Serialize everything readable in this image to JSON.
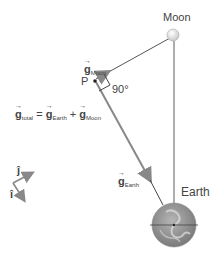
{
  "labels": {
    "moon": "Moon",
    "earth": "Earth",
    "point": "P",
    "angle": "90°",
    "g_moon_symbol": "g",
    "g_moon_sub": "Moon",
    "g_earth_symbol": "g",
    "g_earth_sub": "Earth",
    "equation": {
      "lhs_symbol": "g",
      "lhs_sub": "total",
      "equals": "=",
      "term1_symbol": "g",
      "term1_sub": "Earth",
      "plus": "+",
      "term2_symbol": "g",
      "term2_sub": "Moon"
    },
    "unit_i": "î",
    "unit_j": "ĵ"
  },
  "colors": {
    "line": "#666666",
    "arrow": "#888888",
    "earth_fill": "#8a8a8a",
    "moon_fill": "#f2f2f2"
  }
}
